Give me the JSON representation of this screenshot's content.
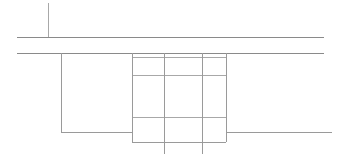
{
  "document": {
    "title": "Technical Line Drawing",
    "kind": "line-drawing",
    "description": "Monochrome architectural elevation detail: two long horizontal rules with a short vertical tick above, a large left rectangle, and a central gridded rectangle whose inner vertical lines extend past the base line.",
    "canvas": {
      "width": 338,
      "height": 160,
      "background_color": "#ffffff"
    },
    "stroke": {
      "color": "#9a9a9a",
      "color_strong": "#8a8a8a",
      "color_light": "#a8a8a8",
      "width": 1
    }
  },
  "drawing_data": {
    "type": "line-drawing",
    "units": "px",
    "horizontal_lines": [
      {
        "name": "upper-datum-line",
        "y": 37,
        "x1": 17,
        "x2": 324,
        "weight": "strong"
      },
      {
        "name": "lower-datum-line",
        "y": 53,
        "x1": 17,
        "x2": 324,
        "weight": "strong"
      },
      {
        "name": "grid-row-divider-1",
        "y": 57,
        "x1": 132,
        "x2": 226,
        "weight": "light"
      },
      {
        "name": "grid-row-divider-2",
        "y": 75,
        "x1": 132,
        "x2": 226,
        "weight": "light"
      },
      {
        "name": "grid-row-divider-3",
        "y": 117,
        "x1": 132,
        "x2": 226,
        "weight": "light"
      },
      {
        "name": "left-block-base-line",
        "y": 132,
        "x1": 61,
        "x2": 132,
        "weight": "normal"
      },
      {
        "name": "right-base-line",
        "y": 132,
        "x1": 226,
        "x2": 332,
        "weight": "normal"
      },
      {
        "name": "grid-bottom-line",
        "y": 142,
        "x1": 132,
        "x2": 226,
        "weight": "normal"
      }
    ],
    "vertical_lines": [
      {
        "name": "top-tick-mark",
        "x": 48,
        "y1": 3,
        "y2": 37,
        "weight": "light"
      },
      {
        "name": "left-block-left-edge",
        "x": 61,
        "y1": 53,
        "y2": 132,
        "weight": "normal"
      },
      {
        "name": "grid-left-edge",
        "x": 132,
        "y1": 53,
        "y2": 142,
        "weight": "normal"
      },
      {
        "name": "grid-inner-column-1",
        "x": 164,
        "y1": 53,
        "y2": 154,
        "weight": "normal"
      },
      {
        "name": "grid-inner-column-2",
        "x": 202,
        "y1": 53,
        "y2": 154,
        "weight": "normal"
      },
      {
        "name": "grid-right-edge",
        "x": 226,
        "y1": 53,
        "y2": 142,
        "weight": "normal"
      }
    ],
    "regions": [
      {
        "name": "left-block",
        "x": 61,
        "y": 53,
        "width": 71,
        "height": 79
      },
      {
        "name": "center-grid",
        "x": 132,
        "y": 53,
        "width": 94,
        "height": 89,
        "rows": 4,
        "columns": 3
      }
    ]
  }
}
